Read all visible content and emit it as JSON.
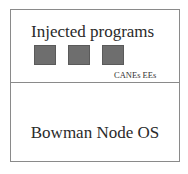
{
  "diagram": {
    "top_section": {
      "title": "Injected programs",
      "blocks": [
        {
          "id": "program-1",
          "color": "#6e6e6e"
        },
        {
          "id": "program-2",
          "color": "#6e6e6e"
        },
        {
          "id": "program-3",
          "color": "#6e6e6e"
        }
      ],
      "label": "CANEs EEs"
    },
    "bottom_section": {
      "label": "Bowman Node OS"
    },
    "colors": {
      "border": "#8a8a8a",
      "block_fill": "#6e6e6e",
      "text": "#2a2a2a",
      "background": "#ffffff"
    }
  }
}
